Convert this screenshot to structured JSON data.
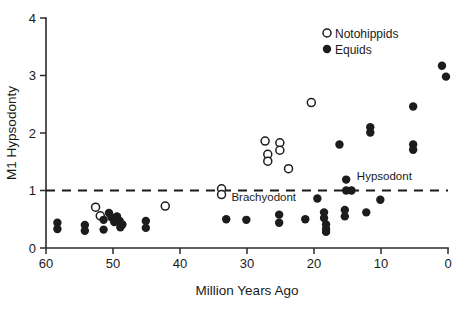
{
  "chart_data": {
    "type": "scatter",
    "title": "",
    "xlabel": "Million Years Ago",
    "ylabel": "M1 Hypsodonty",
    "xlim": [
      60,
      0
    ],
    "ylim": [
      0,
      4
    ],
    "x_ticks": [
      60,
      50,
      40,
      30,
      20,
      10,
      0
    ],
    "y_ticks": [
      0,
      1,
      2,
      3,
      4
    ],
    "x_axis_inverted": true,
    "grid": false,
    "legend_position": "top-right",
    "reference_lines": [
      {
        "name": "hypsodonty-threshold",
        "axis": "y",
        "value": 1,
        "style": "dashed",
        "labels": [
          "Hypsodont",
          "Brachyodont"
        ]
      }
    ],
    "annotations": [
      {
        "text": "Hypsodont",
        "x": 9.5,
        "y": 1.18
      },
      {
        "text": "Brachyodont",
        "x": 27.5,
        "y": 0.82
      }
    ],
    "series": [
      {
        "name": "Notohippids",
        "marker": "open-circle",
        "color": "#ffffff",
        "edge_color": "#1c1c1c",
        "points": [
          [
            52.6,
            0.71
          ],
          [
            51.9,
            0.56
          ],
          [
            42.2,
            0.73
          ],
          [
            33.8,
            1.03
          ],
          [
            33.8,
            0.93
          ],
          [
            27.3,
            1.86
          ],
          [
            26.9,
            1.63
          ],
          [
            26.9,
            1.51
          ],
          [
            25.1,
            1.83
          ],
          [
            25.1,
            1.7
          ],
          [
            23.8,
            1.38
          ],
          [
            20.4,
            2.53
          ]
        ]
      },
      {
        "name": "Equids",
        "marker": "filled-circle",
        "color": "#1c1c1c",
        "edge_color": "#1c1c1c",
        "points": [
          [
            58.3,
            0.44
          ],
          [
            58.3,
            0.33
          ],
          [
            54.2,
            0.4
          ],
          [
            54.2,
            0.3
          ],
          [
            51.4,
            0.49
          ],
          [
            51.4,
            0.32
          ],
          [
            50.6,
            0.61
          ],
          [
            50.2,
            0.53
          ],
          [
            49.8,
            0.45
          ],
          [
            49.4,
            0.55
          ],
          [
            49.0,
            0.47
          ],
          [
            48.6,
            0.41
          ],
          [
            48.9,
            0.36
          ],
          [
            45.1,
            0.47
          ],
          [
            45.1,
            0.35
          ],
          [
            33.1,
            0.5
          ],
          [
            30.1,
            0.49
          ],
          [
            25.2,
            0.58
          ],
          [
            25.2,
            0.44
          ],
          [
            21.3,
            0.5
          ],
          [
            19.5,
            0.86
          ],
          [
            18.5,
            0.62
          ],
          [
            18.5,
            0.52
          ],
          [
            18.2,
            0.41
          ],
          [
            18.2,
            0.33
          ],
          [
            18.2,
            0.28
          ],
          [
            15.2,
            1.19
          ],
          [
            15.2,
            1.0
          ],
          [
            14.4,
            1.0
          ],
          [
            15.4,
            0.66
          ],
          [
            15.4,
            0.55
          ],
          [
            16.2,
            1.8
          ],
          [
            12.2,
            0.62
          ],
          [
            11.6,
            2.1
          ],
          [
            11.6,
            2.01
          ],
          [
            10.1,
            0.84
          ],
          [
            5.2,
            2.46
          ],
          [
            5.2,
            1.8
          ],
          [
            5.2,
            1.71
          ],
          [
            0.9,
            3.17
          ],
          [
            0.3,
            2.98
          ]
        ]
      }
    ]
  },
  "legend": {
    "entries": [
      {
        "label": "Notohippids",
        "marker": "open-circle"
      },
      {
        "label": "Equids",
        "marker": "filled-circle"
      }
    ]
  }
}
